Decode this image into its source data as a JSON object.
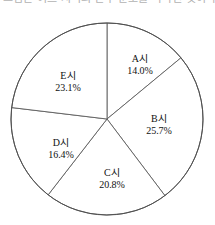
{
  "header": {
    "clipped_text": "그림은 어느 지역의 인구 분포를 나타낸 것이다."
  },
  "chart_data": {
    "type": "pie",
    "title": "",
    "subtitle": "",
    "xlabel": "",
    "ylabel": "",
    "legend_position": "none",
    "grid": false,
    "start_angle_deg": 0,
    "direction": "clockwise",
    "units": "%",
    "center": {
      "x": 107,
      "y": 111
    },
    "radius": 96,
    "categories": [
      "A시",
      "B시",
      "C시",
      "D시",
      "E시"
    ],
    "values": [
      14.0,
      25.7,
      20.8,
      16.4,
      23.1
    ],
    "total": 100.0,
    "slices": [
      {
        "name": "A시",
        "value": 14.0,
        "value_label": "14.0%",
        "start_deg": 0.0,
        "end_deg": 50.4,
        "label_x": 140,
        "label_y": 56,
        "fill": "#ffffff",
        "stroke": "#5d5d5d"
      },
      {
        "name": "B시",
        "value": 25.7,
        "value_label": "25.7%",
        "start_deg": 50.4,
        "end_deg": 142.92,
        "label_x": 159,
        "label_y": 116,
        "fill": "#ffffff",
        "stroke": "#5d5d5d"
      },
      {
        "name": "C시",
        "value": 20.8,
        "value_label": "20.8%",
        "start_deg": 142.92,
        "end_deg": 217.8,
        "label_x": 112,
        "label_y": 170,
        "fill": "#ffffff",
        "stroke": "#5d5d5d"
      },
      {
        "name": "D시",
        "value": 16.4,
        "value_label": "16.4%",
        "start_deg": 217.8,
        "end_deg": 276.84,
        "label_x": 61,
        "label_y": 140,
        "fill": "#ffffff",
        "stroke": "#5d5d5d"
      },
      {
        "name": "E시",
        "value": 23.1,
        "value_label": "23.1%",
        "start_deg": 276.84,
        "end_deg": 360.0,
        "label_x": 68,
        "label_y": 73,
        "fill": "#ffffff",
        "stroke": "#5d5d5d"
      }
    ]
  }
}
